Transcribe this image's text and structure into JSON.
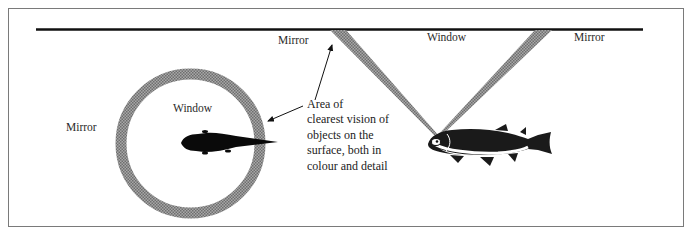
{
  "diagram": {
    "labels": {
      "mirror_left": "Mirror",
      "window_ring": "Window",
      "mirror_top": "Mirror",
      "window_top": "Window",
      "mirror_right": "Mirror"
    },
    "annotation": {
      "lines": [
        "Area of",
        "clearest vision of",
        "objects on the",
        "surface, both in",
        "colour and detail"
      ]
    },
    "colors": {
      "ink": "#111111",
      "band_fill": "#8c8c8c",
      "frame": "#7a7a7a",
      "background": "#ffffff"
    },
    "elements": {
      "surface_line": "water-surface",
      "plan_view": "snell-window-ring-top-view",
      "side_view": "snell-window-cone-side-view"
    }
  }
}
